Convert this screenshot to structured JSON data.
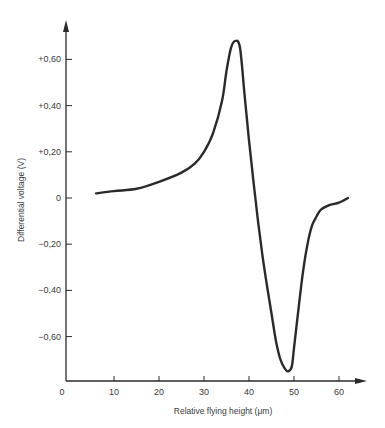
{
  "chart_data": {
    "type": "line",
    "title": "",
    "xlabel": "Relative flying height (μm)",
    "ylabel": "Differential voltage (V)",
    "xlim": [
      0,
      65
    ],
    "ylim": [
      -0.8,
      0.75
    ],
    "grid": false,
    "legend": null,
    "x_ticks": [
      0,
      10,
      20,
      30,
      40,
      50,
      60
    ],
    "x_tick_labels": [
      "0",
      "10",
      "20",
      "30",
      "40",
      "50",
      "60"
    ],
    "y_ticks": [
      0.6,
      0.4,
      0.2,
      0,
      -0.2,
      -0.4,
      -0.6
    ],
    "y_tick_labels": [
      "+0,60",
      "+0,40",
      "+0,20",
      "0",
      "−0,20",
      "−0,40",
      "−0,60"
    ],
    "series": [
      {
        "name": "Differential voltage",
        "color": "#2a2a2a",
        "x": [
          6,
          10,
          15,
          20,
          25,
          28,
          30,
          32,
          34,
          35,
          36,
          37,
          38,
          39,
          40,
          41,
          42,
          43,
          44,
          45,
          46,
          47,
          48,
          48.7,
          49.5,
          50,
          51,
          52,
          53,
          54,
          55,
          56,
          58,
          60,
          62
        ],
        "y": [
          0.02,
          0.03,
          0.04,
          0.07,
          0.11,
          0.15,
          0.2,
          0.28,
          0.42,
          0.55,
          0.65,
          0.68,
          0.65,
          0.45,
          0.25,
          0.07,
          -0.1,
          -0.25,
          -0.38,
          -0.5,
          -0.62,
          -0.7,
          -0.74,
          -0.75,
          -0.73,
          -0.65,
          -0.48,
          -0.32,
          -0.2,
          -0.12,
          -0.08,
          -0.05,
          -0.03,
          -0.02,
          0.0
        ]
      }
    ]
  },
  "axes": {
    "x_title": "Relative flying height (μm)",
    "y_title": "Differential voltage (V)"
  }
}
